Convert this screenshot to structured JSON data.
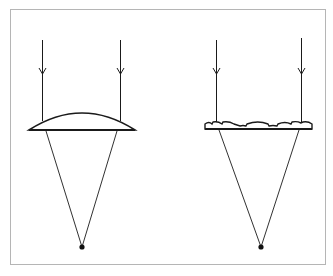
{
  "diagram": {
    "type": "optics",
    "colors": {
      "stroke": "#1a1a1a",
      "frame": "#b5b5b5",
      "background": "#ffffff"
    },
    "panels": [
      {
        "name": "convex-lens",
        "rays_x": [
          42,
          120
        ],
        "focal_point": [
          82,
          247
        ]
      },
      {
        "name": "fresnel-lens",
        "rays_x": [
          216,
          301
        ],
        "focal_point": [
          261,
          247
        ]
      }
    ]
  }
}
